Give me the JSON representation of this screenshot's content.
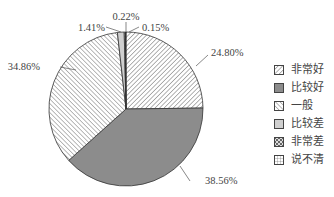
{
  "chart_data": {
    "type": "pie",
    "title": "",
    "start_angle_deg": 0,
    "direction": "clockwise",
    "categories": [
      "非常好",
      "比较好",
      "一般",
      "比较差",
      "说不清",
      "非常差"
    ],
    "values": [
      24.8,
      38.56,
      34.86,
      1.41,
      0.22,
      0.15
    ],
    "labels": [
      "24.80%",
      "38.56%",
      "34.86%",
      "1.41%",
      "0.22%",
      "0.15%"
    ],
    "fills": [
      "hatch-back",
      "gray",
      "hatch-fwd",
      "light-gray",
      "grid",
      "black"
    ],
    "legend_position": "right"
  },
  "legend": [
    {
      "label": "非常好",
      "fill": "hatch-back"
    },
    {
      "label": "比较好",
      "fill": "gray"
    },
    {
      "label": "一般",
      "fill": "hatch-fwd"
    },
    {
      "label": "比较差",
      "fill": "light-gray"
    },
    {
      "label": "非常差",
      "fill": "checker"
    },
    {
      "label": "说不清",
      "fill": "grid"
    }
  ],
  "colors": {
    "gray": "#8c8c8c",
    "light_gray": "#cfcfcf",
    "black": "#111111",
    "outline": "#333333"
  }
}
